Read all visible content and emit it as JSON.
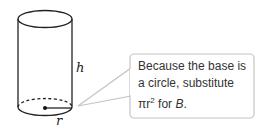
{
  "diagram": {
    "shape": "cylinder",
    "labels": {
      "height": "h",
      "radius": "r"
    }
  },
  "callout": {
    "lines": [
      "Because the base is",
      "a circle, substitute"
    ],
    "line3_prefix": "πr",
    "line3_exponent": "2",
    "line3_middle": " for ",
    "line3_var": "B",
    "line3_suffix": "."
  },
  "colors": {
    "stroke": "#222222",
    "callout_border": "#bdbdbd",
    "text": "#333333"
  }
}
